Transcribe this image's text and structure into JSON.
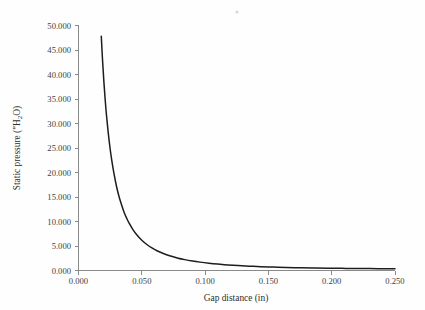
{
  "chart_data": {
    "type": "line",
    "title": "",
    "subtitle": "",
    "xlabel": "Gap distance (in)",
    "ylabel": "Static pressure (\"H₂O)",
    "ylabel_parts": {
      "prefix": "Static pressure (\"H",
      "sub": "2",
      "suffix": "O)"
    },
    "xlim": [
      0.0,
      0.25
    ],
    "ylim": [
      0.0,
      50.0
    ],
    "xticks": [
      0.0,
      0.05,
      0.1,
      0.15,
      0.2,
      0.25
    ],
    "yticks": [
      0.0,
      5.0,
      10.0,
      15.0,
      20.0,
      25.0,
      30.0,
      35.0,
      40.0,
      45.0,
      50.0
    ],
    "xtick_labels": [
      "0.000",
      "0.050",
      "0.100",
      "0.150",
      "0.200",
      "0.250"
    ],
    "ytick_labels": [
      "0.000",
      "5.000",
      "10.000",
      "15.000",
      "20.000",
      "25.000",
      "30.000",
      "35.000",
      "40.000",
      "45.000",
      "50.000"
    ],
    "grid": false,
    "legend": null,
    "legend_position": "none",
    "series": [
      {
        "name": "Static pressure vs gap distance",
        "color": "#1d1d1d",
        "x": [
          0.018,
          0.019,
          0.02,
          0.021,
          0.022,
          0.0235,
          0.025,
          0.0265,
          0.028,
          0.03,
          0.032,
          0.034,
          0.036,
          0.038,
          0.04,
          0.043,
          0.046,
          0.05,
          0.054,
          0.058,
          0.062,
          0.067,
          0.072,
          0.078,
          0.084,
          0.09,
          0.096,
          0.103,
          0.11,
          0.118,
          0.126,
          0.135,
          0.144,
          0.154,
          0.164,
          0.175,
          0.186,
          0.197,
          0.208,
          0.219,
          0.23,
          0.24,
          0.25
        ],
        "y": [
          47.8,
          42.9,
          38.7,
          35.1,
          32.0,
          28.1,
          24.8,
          22.1,
          19.8,
          17.2,
          15.1,
          13.4,
          11.9,
          10.7,
          9.65,
          8.35,
          7.3,
          6.18,
          5.3,
          4.6,
          4.03,
          3.47,
          3.01,
          2.57,
          2.22,
          1.94,
          1.71,
          1.49,
          1.31,
          1.14,
          1.0,
          0.88,
          0.78,
          0.69,
          0.62,
          0.56,
          0.51,
          0.47,
          0.44,
          0.41,
          0.39,
          0.37,
          0.36
        ]
      }
    ]
  },
  "figure": {
    "background_color": "#fefefe",
    "axis_color": "#8a8a8a",
    "text_color": "#2e2e2e",
    "curve_color": "#1d1d1d"
  }
}
